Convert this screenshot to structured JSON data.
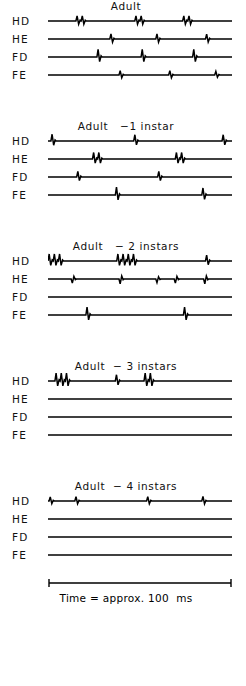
{
  "figure": {
    "channel_labels": [
      "HD",
      "HE",
      "FD",
      "FE"
    ],
    "scalebar": {
      "caption": "Time = approx. 100  ms"
    }
  },
  "panels": [
    {
      "title": "Adult",
      "traces": [
        {
          "label": "HD",
          "spikes": [
            {
              "x": 18,
              "amp": 1.0,
              "type": "burst",
              "n": 2
            },
            {
              "x": 50,
              "amp": 1.0,
              "type": "burst",
              "n": 2
            },
            {
              "x": 76,
              "amp": 1.0,
              "type": "burst",
              "n": 2
            }
          ]
        },
        {
          "label": "HE",
          "spikes": [
            {
              "x": 35,
              "amp": 1.0,
              "type": "single"
            },
            {
              "x": 60,
              "amp": 1.0,
              "type": "single"
            },
            {
              "x": 87,
              "amp": 0.95,
              "type": "single"
            }
          ]
        },
        {
          "label": "FD",
          "spikes": [
            {
              "x": 28,
              "amp": 1.45,
              "type": "single"
            },
            {
              "x": 52,
              "amp": 1.45,
              "type": "single"
            },
            {
              "x": 80,
              "amp": 1.45,
              "type": "single"
            }
          ]
        },
        {
          "label": "FE",
          "spikes": [
            {
              "x": 40,
              "amp": 0.85,
              "type": "single"
            },
            {
              "x": 67,
              "amp": 0.85,
              "type": "single"
            },
            {
              "x": 92,
              "amp": 0.7,
              "type": "single"
            }
          ]
        }
      ]
    },
    {
      "title": "Adult   −1 instar",
      "traces": [
        {
          "label": "HD",
          "spikes": [
            {
              "x": 3,
              "amp": 1.3,
              "type": "single"
            },
            {
              "x": 48,
              "amp": 1.2,
              "type": "single"
            },
            {
              "x": 96,
              "amp": 1.2,
              "type": "single"
            }
          ]
        },
        {
          "label": "HE",
          "spikes": [
            {
              "x": 27,
              "amp": 1.25,
              "type": "burst",
              "n": 2
            },
            {
              "x": 72,
              "amp": 1.25,
              "type": "burst",
              "n": 2
            }
          ]
        },
        {
          "label": "FD",
          "spikes": [
            {
              "x": 17,
              "amp": 1.1,
              "type": "single"
            },
            {
              "x": 61,
              "amp": 1.1,
              "type": "single"
            }
          ]
        },
        {
          "label": "FE",
          "spikes": [
            {
              "x": 38,
              "amp": 1.5,
              "type": "single"
            },
            {
              "x": 85,
              "amp": 1.35,
              "type": "single"
            }
          ]
        }
      ]
    },
    {
      "title": "Adult   − 2 instars",
      "traces": [
        {
          "label": "HD",
          "spikes": [
            {
              "x": 3,
              "amp": 1.35,
              "type": "burst",
              "n": 3
            },
            {
              "x": 43,
              "amp": 1.35,
              "type": "burst",
              "n": 4
            },
            {
              "x": 87,
              "amp": 1.15,
              "type": "single"
            }
          ]
        },
        {
          "label": "HE",
          "spikes": [
            {
              "x": 14,
              "amp": -0.8,
              "type": "single"
            },
            {
              "x": 40,
              "amp": -0.95,
              "type": "single"
            },
            {
              "x": 60,
              "amp": -0.7,
              "type": "single"
            },
            {
              "x": 70,
              "amp": -0.8,
              "type": "single"
            },
            {
              "x": 86,
              "amp": -0.95,
              "type": "single"
            }
          ]
        },
        {
          "label": "FD",
          "spikes": []
        },
        {
          "label": "FE",
          "spikes": [
            {
              "x": 22,
              "amp": 1.5,
              "type": "single"
            },
            {
              "x": 75,
              "amp": 1.5,
              "type": "single"
            }
          ]
        }
      ]
    },
    {
      "title": "Adult  − 3 instars",
      "traces": [
        {
          "label": "HD",
          "spikes": [
            {
              "x": 8,
              "amp": 1.5,
              "type": "burst",
              "n": 3
            },
            {
              "x": 38,
              "amp": 1.2,
              "type": "single"
            },
            {
              "x": 55,
              "amp": 1.5,
              "type": "burst",
              "n": 2
            }
          ]
        },
        {
          "label": "HE",
          "spikes": []
        },
        {
          "label": "FD",
          "spikes": []
        },
        {
          "label": "FE",
          "spikes": []
        }
      ]
    },
    {
      "title": "Adult  − 4 instars",
      "traces": [
        {
          "label": "HD",
          "spikes": [
            {
              "x": 2,
              "amp": 0.8,
              "type": "single"
            },
            {
              "x": 16,
              "amp": 0.85,
              "type": "single"
            },
            {
              "x": 55,
              "amp": 0.85,
              "type": "single"
            },
            {
              "x": 85,
              "amp": 0.9,
              "type": "single"
            }
          ]
        },
        {
          "label": "HE",
          "spikes": []
        },
        {
          "label": "FD",
          "spikes": []
        },
        {
          "label": "FE",
          "spikes": []
        }
      ]
    }
  ]
}
